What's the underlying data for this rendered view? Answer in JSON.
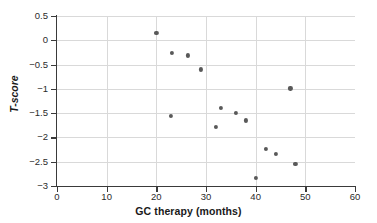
{
  "chart_data": {
    "type": "scatter",
    "title": "",
    "xlabel": "GC therapy (months)",
    "ylabel": "T-score",
    "xlim": [
      0,
      60
    ],
    "ylim": [
      -3,
      0.5
    ],
    "xticks": [
      0,
      10,
      20,
      30,
      40,
      50,
      60
    ],
    "xtick_labels": [
      "0",
      "10",
      "20",
      "30",
      "40",
      "50",
      "60"
    ],
    "yticks": [
      0.5,
      0,
      -0.5,
      -1,
      -1.5,
      -2,
      -2.5,
      -3
    ],
    "ytick_labels": [
      "0.5",
      "0",
      "−0.5",
      "−1",
      "−1.5",
      "−2",
      "−2.5",
      "−3"
    ],
    "grid": true,
    "legend": null,
    "marker_color": "#595959",
    "grid_color": "#d9d9d9",
    "axis_color": "#3a3a3a",
    "points": [
      {
        "x": 20.0,
        "y": 0.15
      },
      {
        "x": 23.1,
        "y": -0.26
      },
      {
        "x": 26.4,
        "y": -0.31
      },
      {
        "x": 29.0,
        "y": -0.6
      },
      {
        "x": 47.0,
        "y": -0.99
      },
      {
        "x": 33.0,
        "y": -1.4
      },
      {
        "x": 36.0,
        "y": -1.49
      },
      {
        "x": 23.0,
        "y": -1.56
      },
      {
        "x": 38.0,
        "y": -1.65
      },
      {
        "x": 32.0,
        "y": -1.79
      },
      {
        "x": 42.0,
        "y": -2.24
      },
      {
        "x": 44.0,
        "y": -2.34
      },
      {
        "x": 48.0,
        "y": -2.55
      },
      {
        "x": 40.0,
        "y": -2.84
      }
    ]
  }
}
